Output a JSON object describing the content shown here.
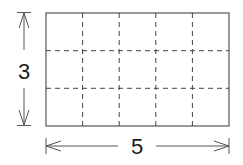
{
  "diagram": {
    "type": "grid-rectangle-dimensions",
    "rows": 3,
    "columns": 5,
    "height_label": "3",
    "width_label": "5",
    "colors": {
      "stroke": "#555555",
      "dash": "#444444",
      "text": "#1a1a1a",
      "background": "#ffffff"
    }
  }
}
